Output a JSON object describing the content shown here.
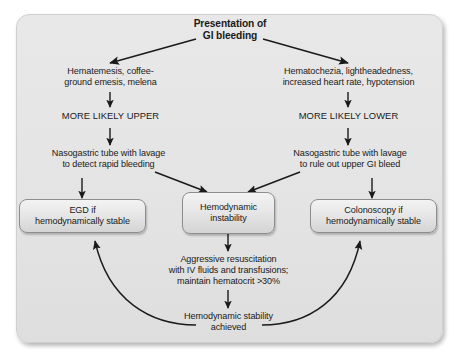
{
  "figure": {
    "kind": "clinical-flowchart",
    "panel_bg_color": "#e5e5e5",
    "box_fill_color": "#e9e9e9",
    "box_border_color": "#8d8d8d",
    "text_color": "#1a1a1a",
    "arrow_color": "#1a1a1a"
  },
  "nodes": {
    "title": "Presentation of\nGI bleeding",
    "upper_symptoms": "Hematemesis, coffee-\nground emesis, melena",
    "lower_symptoms": "Hematochezia, lightheadedness,\nincreased heart rate, hypotension",
    "more_likely_upper": "MORE LIKELY UPPER",
    "more_likely_lower": "MORE LIKELY LOWER",
    "ng_tube_left": "Nasogastric tube with lavage\nto detect rapid bleeding",
    "ng_tube_right": "Nasogastric tube with lavage\nto rule out upper GI bleed",
    "egd_box": "EGD if\nhemodynamically stable",
    "instability_box": "Hemodynamic\ninstability",
    "colonoscopy_box": "Colonoscopy if\nhemodynamically stable",
    "resuscitation": "Aggressive resuscitation\nwith IV fluids and transfusions;\nmaintain hematocrit >30%",
    "stability_achieved": "Hemodynamic stability\nachieved"
  },
  "edges": [
    {
      "id": "title-to-upper",
      "from": "title",
      "to": "upper_symptoms",
      "style": "diagonal-arrow"
    },
    {
      "id": "title-to-lower",
      "from": "title",
      "to": "lower_symptoms",
      "style": "diagonal-arrow"
    },
    {
      "id": "upper-to-mlu",
      "from": "upper_symptoms",
      "to": "more_likely_upper",
      "style": "straight-arrow"
    },
    {
      "id": "lower-to-mll",
      "from": "lower_symptoms",
      "to": "more_likely_lower",
      "style": "straight-arrow"
    },
    {
      "id": "mlu-to-ngl",
      "from": "more_likely_upper",
      "to": "ng_tube_left",
      "style": "straight-arrow"
    },
    {
      "id": "mll-to-ngr",
      "from": "more_likely_lower",
      "to": "ng_tube_right",
      "style": "straight-arrow"
    },
    {
      "id": "ngl-to-egd",
      "from": "ng_tube_left",
      "to": "egd_box",
      "style": "straight-arrow"
    },
    {
      "id": "ngr-to-colonoscopy",
      "from": "ng_tube_right",
      "to": "colonoscopy_box",
      "style": "straight-arrow"
    },
    {
      "id": "ngl-to-instability",
      "from": "ng_tube_left",
      "to": "instability_box",
      "style": "diagonal-arrow"
    },
    {
      "id": "ngr-to-instability",
      "from": "ng_tube_right",
      "to": "instability_box",
      "style": "diagonal-arrow"
    },
    {
      "id": "instability-to-resus",
      "from": "instability_box",
      "to": "resuscitation",
      "style": "straight-arrow"
    },
    {
      "id": "resus-to-stability",
      "from": "resuscitation",
      "to": "stability_achieved",
      "style": "straight-arrow"
    },
    {
      "id": "stability-to-egd",
      "from": "stability_achieved",
      "to": "egd_box",
      "style": "curved-arrow-left"
    },
    {
      "id": "stability-to-colonoscopy",
      "from": "stability_achieved",
      "to": "colonoscopy_box",
      "style": "curved-arrow-right"
    }
  ]
}
